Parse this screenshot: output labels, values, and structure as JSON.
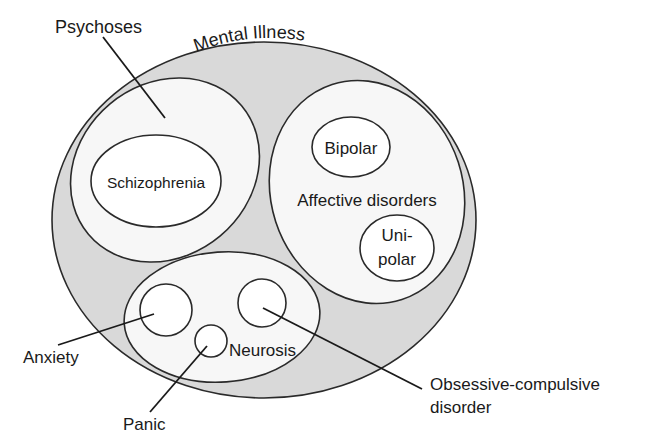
{
  "diagram": {
    "type": "nested-venn",
    "title": "Mental Illness",
    "colors": {
      "outer_fill": "#d9d9d9",
      "inner_fill": "#f7f7f7",
      "stroke": "#2a2a2a",
      "text": "#1a1a1a"
    },
    "outer": {
      "label": "Mental Illness"
    },
    "groups": [
      {
        "id": "psychoses",
        "label": "Psychoses",
        "members": [
          {
            "id": "schizophrenia",
            "label": "Schizophrenia"
          }
        ]
      },
      {
        "id": "affective",
        "label": "Affective disorders",
        "members": [
          {
            "id": "bipolar",
            "label": "Bipolar"
          },
          {
            "id": "unipolar",
            "label_line1": "Uni-",
            "label_line2": "polar"
          }
        ]
      },
      {
        "id": "neurosis",
        "label": "Neurosis",
        "members": [
          {
            "id": "anxiety",
            "label": "Anxiety"
          },
          {
            "id": "panic",
            "label": "Panic"
          },
          {
            "id": "ocd",
            "label_line1": "Obsessive-compulsive",
            "label_line2": "disorder"
          }
        ]
      }
    ]
  }
}
